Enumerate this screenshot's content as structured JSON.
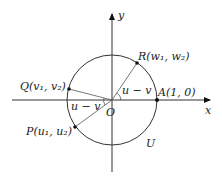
{
  "diagram": {
    "axes": {
      "x_label": "x",
      "y_label": "y",
      "origin_label": "O"
    },
    "circle_label": "U",
    "points": {
      "A": {
        "name": "A",
        "coords": "(1, 0)"
      },
      "R": {
        "name": "R",
        "coords": "(w₁, w₂)"
      },
      "Q": {
        "name": "Q",
        "coords": "(v₁, v₂)"
      },
      "P": {
        "name": "P",
        "coords": "(u₁, u₂)"
      }
    },
    "angle_labels": {
      "upper": "u − v",
      "lower": "u − v"
    },
    "colors": {
      "stroke": "#333333",
      "point": "#111111",
      "background": "#ffffff"
    }
  }
}
